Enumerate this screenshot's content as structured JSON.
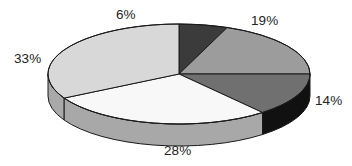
{
  "chart_data": {
    "type": "pie",
    "title": "",
    "subtitle": "",
    "xlabel": "",
    "ylabel": "",
    "grid": false,
    "legend": "none",
    "label_format": "percent",
    "three_d": true,
    "start_angle_deg": 0,
    "direction": "clockwise",
    "categories": [
      "6%",
      "19%",
      "14%",
      "28%",
      "33%"
    ],
    "values": [
      6,
      19,
      14,
      28,
      33
    ],
    "total": 100,
    "slices": [
      {
        "label": "6%",
        "value": 6,
        "top_color": "#3b3b3b",
        "side_color": "#1d1d1d",
        "start_deg": 0,
        "end_deg": 21.6,
        "label_x": 116,
        "label_y": 8
      },
      {
        "label": "19%",
        "value": 19,
        "top_color": "#9c9c9c",
        "side_color": "#6e6e6e",
        "start_deg": 21.6,
        "end_deg": 90.0,
        "label_x": 251,
        "label_y": 14
      },
      {
        "label": "14%",
        "value": 14,
        "top_color": "#707070",
        "side_color": "#111111",
        "start_deg": 90.0,
        "end_deg": 140.4,
        "label_x": 315,
        "label_y": 94
      },
      {
        "label": "28%",
        "value": 28,
        "top_color": "#f8f8f8",
        "side_color": "#a8a8a8",
        "start_deg": 140.4,
        "end_deg": 241.2,
        "label_x": 164,
        "label_y": 144
      },
      {
        "label": "33%",
        "value": 33,
        "top_color": "#d8d8d8",
        "side_color": "#a9a9a9",
        "start_deg": 241.2,
        "end_deg": 360.0,
        "label_x": 14,
        "label_y": 52
      }
    ],
    "geometry": {
      "center_x": 179,
      "center_y": 74,
      "radius_x": 131,
      "radius_y": 50,
      "depth": 22
    },
    "colors": {
      "background": "#ffffff",
      "outline": "#1a1a1a",
      "label_text": "#232323"
    }
  }
}
